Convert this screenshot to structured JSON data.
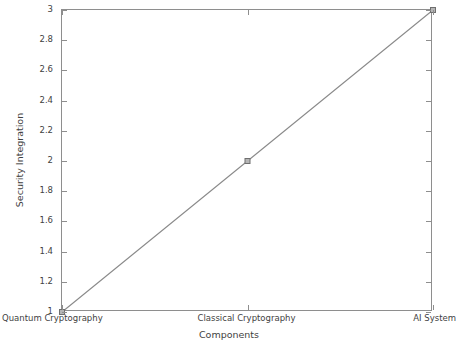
{
  "chart_data": {
    "type": "line",
    "title": "",
    "subtitle": "",
    "xlabel": "Components",
    "ylabel": "Security Integration",
    "categories": [
      "Quantum Cryptography",
      "Classical Cryptography",
      "AI System"
    ],
    "x": [
      1,
      2,
      3
    ],
    "values": [
      1,
      2,
      3
    ],
    "series": [
      {
        "name": "Security Integration",
        "values": [
          1,
          2,
          3
        ],
        "color": "#8a8a8a",
        "marker": "square",
        "marker_color": "#8a8a8a",
        "line_style": "solid"
      }
    ],
    "ylim": [
      1,
      3
    ],
    "yticks": [
      1,
      1.2,
      1.4,
      1.6,
      1.8,
      2,
      2.2,
      2.4,
      2.6,
      2.8,
      3
    ],
    "ytick_labels": [
      "1",
      "1.2",
      "1.4",
      "1.6",
      "1.8",
      "2",
      "2.2",
      "2.4",
      "2.6",
      "2.8",
      "3"
    ],
    "xlim": [
      1,
      3
    ],
    "xticks": [
      1,
      2,
      3
    ],
    "xtick_labels": [
      "Quantum Cryptography",
      "Classical Cryptography",
      "AI System"
    ],
    "grid": false,
    "legend": false,
    "legend_position": "none",
    "box": true,
    "tick_direction": "in",
    "annotations": []
  },
  "style": {
    "background": "#ffffff",
    "axis_color": "#8e8e8e",
    "text_color": "#3f3f3f",
    "line_color": "#8a8a8a",
    "marker_fill": "#b5b5b5",
    "marker_edge": "#6f6f6f"
  }
}
